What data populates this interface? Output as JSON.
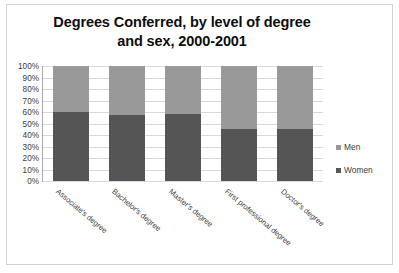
{
  "chart_data": {
    "type": "bar",
    "subtype": "stacked-percent",
    "title": "Degrees Conferred, by level of degree and sex, 2000-2001",
    "title_lines": [
      "Degrees Conferred, by level of degree",
      "and sex, 2000-2001"
    ],
    "categories": [
      "Associate's degree",
      "Bachelor's degree",
      "Master's degree",
      "First professional degree",
      "Doctor's degree"
    ],
    "series": [
      {
        "name": "Women",
        "color": "#555555",
        "values": [
          60,
          57,
          58,
          45.5,
          45
        ]
      },
      {
        "name": "Men",
        "color": "#999999",
        "values": [
          40,
          43,
          42,
          54.5,
          55
        ]
      }
    ],
    "stack_order": [
      "Women",
      "Men"
    ],
    "xlabel": "",
    "ylabel": "",
    "ylim": [
      0,
      100
    ],
    "ytick_labels": [
      "100%",
      "90%",
      "80%",
      "70%",
      "60%",
      "50%",
      "40%",
      "30%",
      "20%",
      "10%",
      "0%"
    ],
    "ytick_values": [
      100,
      90,
      80,
      70,
      60,
      50,
      40,
      30,
      20,
      10,
      0
    ],
    "grid": true,
    "legend_position": "right",
    "legend_entries": [
      {
        "label": "Men",
        "color": "#999999"
      },
      {
        "label": "Women",
        "color": "#555555"
      }
    ]
  }
}
